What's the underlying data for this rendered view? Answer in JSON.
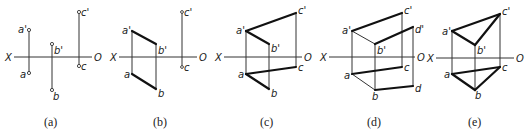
{
  "figure": {
    "axis_labels": {
      "left": "X",
      "right": "O"
    },
    "panels": [
      {
        "caption": "(a)",
        "points": {
          "a_prime": "a'",
          "a": "a",
          "b_prime": "b'",
          "b": "b",
          "c_prime": "c'",
          "c": "c"
        }
      },
      {
        "caption": "(b)",
        "points": {
          "a_prime": "a'",
          "a": "a",
          "b_prime": "b'",
          "b": "b",
          "c_prime": "c'",
          "c": "c"
        }
      },
      {
        "caption": "(c)",
        "points": {
          "a_prime": "a'",
          "a": "a",
          "b_prime": "b'",
          "b": "b",
          "c_prime": "c'",
          "c": "c"
        }
      },
      {
        "caption": "(d)",
        "points": {
          "a_prime": "a'",
          "a": "a",
          "b_prime": "b'",
          "b": "b",
          "c_prime": "c'",
          "c": "c",
          "d_prime": "d'",
          "d": "d"
        }
      },
      {
        "caption": "(e)",
        "points": {
          "a_prime": "a'",
          "a": "a",
          "b_prime": "b'",
          "b": "b",
          "c_prime": "c'",
          "c": "c"
        }
      }
    ]
  }
}
